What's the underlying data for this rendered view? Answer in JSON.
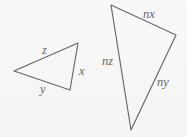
{
  "figure": {
    "background_color": "#f7f7f7",
    "stroke_color": "#2a2a2a",
    "text_color": "#1c1c1c",
    "width": 187,
    "height": 137,
    "triangles": [
      {
        "name": "small-triangle",
        "vertices": [
          {
            "name": "left-vertex",
            "x": 14,
            "y": 71
          },
          {
            "name": "top-right-vertex",
            "x": 78,
            "y": 43
          },
          {
            "name": "bottom-right-vertex",
            "x": 70,
            "y": 90
          }
        ],
        "path": "M 14 71 L 78 43 L 70 90 Z",
        "labels": [
          {
            "name": "side-label-z",
            "text": "z",
            "x": 42,
            "y": 44
          },
          {
            "name": "side-label-x",
            "text": "x",
            "x": 79,
            "y": 65
          },
          {
            "name": "side-label-y",
            "text": "y",
            "x": 40,
            "y": 83
          }
        ]
      },
      {
        "name": "large-triangle",
        "vertices": [
          {
            "name": "top-vertex",
            "x": 111,
            "y": 5
          },
          {
            "name": "right-vertex",
            "x": 176,
            "y": 35
          },
          {
            "name": "bottom-vertex",
            "x": 131,
            "y": 130
          }
        ],
        "path": "M 111 5 L 176 35 L 131 130 Z",
        "labels": [
          {
            "name": "side-label-nx",
            "text": "nx",
            "x": 143,
            "y": 8
          },
          {
            "name": "side-label-nz",
            "text": "nz",
            "x": 102,
            "y": 55
          },
          {
            "name": "side-label-ny",
            "text": "ny",
            "x": 157,
            "y": 76
          }
        ]
      }
    ]
  }
}
